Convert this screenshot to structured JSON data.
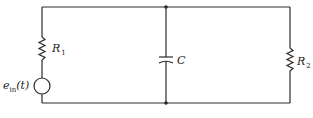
{
  "diagram": {
    "type": "circuit-schematic",
    "components": [
      {
        "id": "R1",
        "kind": "resistor",
        "label": "R",
        "subscript": "1",
        "branch": "left"
      },
      {
        "id": "ein",
        "kind": "voltage-source",
        "label": "e",
        "subscript": "in",
        "arg": "(t)",
        "branch": "left"
      },
      {
        "id": "C",
        "kind": "capacitor",
        "label": "C",
        "branch": "middle"
      },
      {
        "id": "R2",
        "kind": "resistor",
        "label": "R",
        "subscript": "2",
        "branch": "right"
      }
    ],
    "nodes": [
      "top-junction",
      "bottom-junction"
    ],
    "colors": {
      "line": "#2a2a2a",
      "background": "#ffffff"
    }
  }
}
